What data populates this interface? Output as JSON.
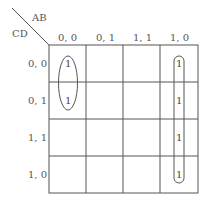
{
  "kmap": {
    "row_var": "CD",
    "col_var": "AB",
    "col_headers": [
      "0, 0",
      "0, 1",
      "1, 1",
      "1, 0"
    ],
    "row_headers": [
      "0, 0",
      "0, 1",
      "1, 1",
      "1, 0"
    ],
    "cells": [
      [
        "1",
        "",
        "",
        "1"
      ],
      [
        "1",
        "",
        "",
        "1"
      ],
      [
        "",
        "",
        "",
        "1"
      ],
      [
        "",
        "",
        "",
        "1"
      ]
    ],
    "groups": [
      {
        "name": "group-col00-rows00-01",
        "cells": [
          [
            0,
            0
          ],
          [
            1,
            0
          ]
        ]
      },
      {
        "name": "group-col10-all-rows",
        "cells": [
          [
            0,
            3
          ],
          [
            1,
            3
          ],
          [
            2,
            3
          ],
          [
            3,
            3
          ]
        ]
      }
    ]
  }
}
